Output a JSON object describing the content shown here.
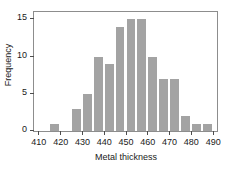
{
  "chart_data": {
    "type": "bar",
    "title": "",
    "subtitle": "",
    "xlabel": "Metal thickness",
    "ylabel": "Frequency",
    "grid": false,
    "legend": null,
    "bin_width": 5,
    "xlim": [
      408,
      492
    ],
    "ylim": [
      0,
      16
    ],
    "xticks": [
      410,
      420,
      430,
      440,
      450,
      460,
      470,
      480,
      490
    ],
    "yticks": [
      0,
      5,
      10,
      15
    ],
    "bin_edges": [
      410,
      415,
      420,
      425,
      430,
      435,
      440,
      445,
      450,
      455,
      460,
      465,
      470,
      475,
      480,
      485,
      490
    ],
    "categories": [
      "410-415",
      "415-420",
      "420-425",
      "425-430",
      "430-435",
      "435-440",
      "440-445",
      "445-450",
      "450-455",
      "455-460",
      "460-465",
      "465-470",
      "470-475",
      "475-480",
      "480-485",
      "485-490"
    ],
    "bin_centers": [
      412.5,
      417.5,
      422.5,
      427.5,
      432.5,
      437.5,
      442.5,
      447.5,
      452.5,
      457.5,
      462.5,
      467.5,
      472.5,
      477.5,
      482.5,
      487.5
    ],
    "values": [
      0,
      1,
      0,
      3,
      5,
      10,
      9,
      14,
      15,
      15,
      10,
      7,
      7,
      2,
      1,
      1
    ],
    "bar_color": "#a3a3a3",
    "axis_color": "#8d8d8d",
    "text_color": "#1a1a1a"
  }
}
